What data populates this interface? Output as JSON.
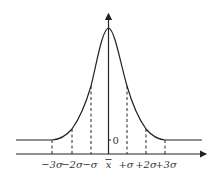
{
  "diagram": {
    "origin_label": "0",
    "mean_label": "x",
    "tick_labels": [
      "−3σ",
      "−2σ",
      "−σ",
      "+σ",
      "+2σ",
      "+3σ"
    ],
    "colors": {
      "stroke": "#222222",
      "background": "#ffffff"
    }
  }
}
